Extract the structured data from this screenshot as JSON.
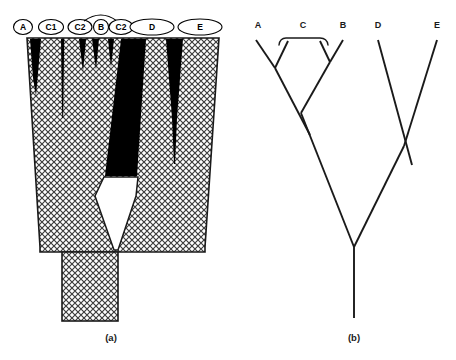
{
  "figure": {
    "background_color": "#ffffff",
    "ink_color": "#000000",
    "hatch_color": "#4d4d4d"
  },
  "panel_a": {
    "caption": "(a)",
    "type": "spindle-diagram",
    "label_shape": "ellipse",
    "labels": [
      {
        "id": "A",
        "text": "A",
        "cx": 23,
        "cy": 27,
        "rx": 9.5,
        "ry": 7.5
      },
      {
        "id": "C1",
        "text": "C1",
        "cx": 51,
        "cy": 27,
        "rx": 12.5,
        "ry": 7.5
      },
      {
        "id": "C2a",
        "text": "C2",
        "cx": 80,
        "cy": 27,
        "rx": 12.0,
        "ry": 7.5
      },
      {
        "id": "B",
        "text": "B",
        "cx": 101,
        "cy": 27,
        "rx": 7.5,
        "ry": 7.5
      },
      {
        "id": "C2b",
        "text": "C2",
        "cx": 121,
        "cy": 27,
        "rx": 12.0,
        "ry": 7.5
      },
      {
        "id": "D",
        "text": "D",
        "cx": 152,
        "cy": 27,
        "rx": 22.0,
        "ry": 8.0
      },
      {
        "id": "E",
        "text": "E",
        "cx": 200,
        "cy": 27,
        "rx": 22.0,
        "ry": 8.0
      }
    ],
    "connector": {
      "name": "c2-linking-arc",
      "from": "C2a",
      "to": "C2b",
      "over": "B"
    },
    "lineages": [
      {
        "id": "A",
        "style": "black-wedge",
        "note": "short tapering black wedge at left margin"
      },
      {
        "id": "C1",
        "style": "thin-line",
        "note": "narrow black line descending mid-depth"
      },
      {
        "id": "C2a",
        "style": "black-wedge",
        "note": "very short black wedge"
      },
      {
        "id": "B",
        "style": "black-wedge",
        "note": "very short black wedge"
      },
      {
        "id": "C2b",
        "style": "black-wedge",
        "note": "very short black wedge"
      },
      {
        "id": "D",
        "style": "broad-black-wedge",
        "note": "wide black mass narrowing downward, ends at white zone"
      },
      {
        "id": "E",
        "style": "black-wedge-tail",
        "note": "black wedge tapering into long thin line"
      }
    ],
    "white_zone": {
      "name": "unfilled-central-region",
      "note": "white kite-shaped gap below the D mass"
    },
    "stem": {
      "name": "basal-stem",
      "note": "vertical cross-hatched column at base"
    }
  },
  "panel_b": {
    "caption": "(b)",
    "type": "cladogram",
    "taxa": [
      {
        "id": "A",
        "text": "A",
        "x": 258,
        "y": 26
      },
      {
        "id": "C",
        "text": "C",
        "x": 303,
        "y": 26
      },
      {
        "id": "B",
        "text": "B",
        "x": 343,
        "y": 26
      },
      {
        "id": "D",
        "text": "D",
        "x": 378,
        "y": 26
      },
      {
        "id": "E",
        "text": "E",
        "x": 437,
        "y": 26
      }
    ],
    "bracket": {
      "name": "clade-c-bracket",
      "spans": "C",
      "x_left": 280,
      "x_right": 328,
      "y": 40
    },
    "nodes": [
      {
        "id": "node-A-C1",
        "x": 275,
        "y": 68
      },
      {
        "id": "node-B-C2",
        "x": 330,
        "y": 62
      },
      {
        "id": "node-ABC",
        "x": 301,
        "y": 113
      },
      {
        "id": "node-DE",
        "x": 404,
        "y": 146
      },
      {
        "id": "root",
        "x": 354,
        "y": 247
      }
    ],
    "root_stem": {
      "name": "root-stem",
      "x": 354,
      "y_top": 247,
      "y_bottom": 318
    }
  }
}
